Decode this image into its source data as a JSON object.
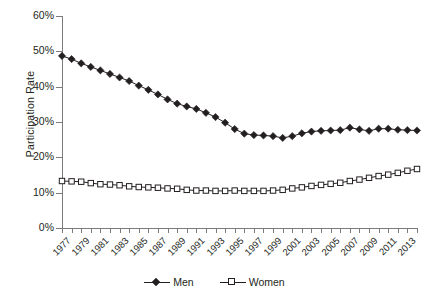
{
  "chart_data": {
    "type": "line",
    "title": "",
    "xlabel": "",
    "ylabel": "Participation Rate",
    "ylim": [
      0,
      60
    ],
    "ytick_labels": [
      "0%",
      "10%",
      "20%",
      "30%",
      "40%",
      "50%",
      "60%"
    ],
    "ytick_values": [
      0,
      10,
      20,
      30,
      40,
      50,
      60
    ],
    "grid": false,
    "legend_position": "bottom-center",
    "x": [
      1977,
      1978,
      1979,
      1980,
      1981,
      1982,
      1983,
      1984,
      1985,
      1986,
      1987,
      1988,
      1989,
      1990,
      1991,
      1992,
      1993,
      1994,
      1995,
      1996,
      1997,
      1998,
      1999,
      2000,
      2001,
      2002,
      2003,
      2004,
      2005,
      2006,
      2007,
      2008,
      2009,
      2010,
      2011,
      2012,
      2013,
      2014
    ],
    "xtick_labels": [
      "1977",
      "1979",
      "1981",
      "1983",
      "1985",
      "1987",
      "1989",
      "1991",
      "1993",
      "1995",
      "1997",
      "1999",
      "2001",
      "2003",
      "2005",
      "2007",
      "2009",
      "2011",
      "2013"
    ],
    "xlim": [
      1977,
      2014
    ],
    "series": [
      {
        "name": "Men",
        "marker": "filled-diamond",
        "color": "#231f20",
        "values": [
          48.7,
          47.8,
          46.6,
          45.6,
          44.6,
          43.6,
          42.6,
          41.6,
          40.3,
          39.1,
          37.8,
          36.4,
          35.2,
          34.4,
          33.7,
          32.6,
          31.4,
          29.8,
          28.0,
          26.7,
          26.3,
          26.2,
          26.0,
          25.5,
          26.0,
          26.8,
          27.3,
          27.5,
          27.6,
          27.7,
          28.4,
          27.9,
          27.5,
          28.1,
          28.1,
          27.8,
          27.7,
          27.6
        ]
      },
      {
        "name": "Women",
        "marker": "open-square",
        "color": "#231f20",
        "values": [
          13.3,
          13.2,
          13.1,
          12.7,
          12.4,
          12.3,
          12.1,
          11.8,
          11.6,
          11.5,
          11.4,
          11.2,
          11.1,
          10.8,
          10.6,
          10.6,
          10.5,
          10.5,
          10.6,
          10.5,
          10.5,
          10.5,
          10.6,
          10.8,
          11.2,
          11.5,
          11.9,
          12.2,
          12.5,
          12.8,
          13.3,
          13.7,
          14.2,
          14.7,
          15.1,
          15.6,
          16.2,
          16.7
        ]
      }
    ]
  },
  "legend": {
    "entries": [
      {
        "label": "Men"
      },
      {
        "label": "Women"
      }
    ]
  }
}
